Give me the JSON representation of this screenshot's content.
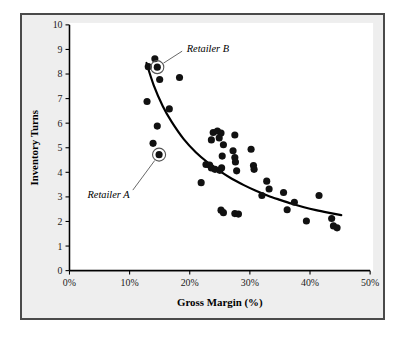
{
  "figure": {
    "frame_color": "#4a4a4a",
    "background_color": "#eeeeee",
    "plot_background_color": "#ffffff"
  },
  "chart_data": {
    "type": "scatter",
    "title": "",
    "xlabel": "Gross Margin (%)",
    "ylabel": "Inventory Turns",
    "xlim": [
      0,
      50
    ],
    "ylim": [
      0,
      10
    ],
    "xticks": [
      0,
      10,
      20,
      30,
      40,
      50
    ],
    "xtick_labels": [
      "0%",
      "10%",
      "20%",
      "30%",
      "40%",
      "50%"
    ],
    "yticks": [
      0,
      1,
      2,
      3,
      4,
      5,
      6,
      7,
      8,
      9,
      10
    ],
    "ytick_labels": [
      "0",
      "1",
      "2",
      "3",
      "4",
      "5",
      "6",
      "7",
      "8",
      "9",
      "10"
    ],
    "grid": false,
    "legend": null,
    "marker_color": "#111111",
    "trendline_color": "#000000",
    "points": [
      [
        13.1,
        8.3
      ],
      [
        14.2,
        8.62
      ],
      [
        14.6,
        8.28
      ],
      [
        15.0,
        7.78
      ],
      [
        18.3,
        7.86
      ],
      [
        12.9,
        6.88
      ],
      [
        16.6,
        6.58
      ],
      [
        14.6,
        5.88
      ],
      [
        13.9,
        5.18
      ],
      [
        14.9,
        4.72
      ],
      [
        23.9,
        5.62
      ],
      [
        24.6,
        5.68
      ],
      [
        25.2,
        5.6
      ],
      [
        24.9,
        5.4
      ],
      [
        27.5,
        5.52
      ],
      [
        23.6,
        5.32
      ],
      [
        25.6,
        5.12
      ],
      [
        25.4,
        4.66
      ],
      [
        27.2,
        4.88
      ],
      [
        27.5,
        4.6
      ],
      [
        27.6,
        4.42
      ],
      [
        30.2,
        4.94
      ],
      [
        22.7,
        4.32
      ],
      [
        23.3,
        4.3
      ],
      [
        23.6,
        4.18
      ],
      [
        24.2,
        4.12
      ],
      [
        25.0,
        4.08
      ],
      [
        25.3,
        4.18
      ],
      [
        27.8,
        4.06
      ],
      [
        30.6,
        4.28
      ],
      [
        30.7,
        4.12
      ],
      [
        21.9,
        3.58
      ],
      [
        32.8,
        3.64
      ],
      [
        33.2,
        3.32
      ],
      [
        32.0,
        3.06
      ],
      [
        35.6,
        3.18
      ],
      [
        37.4,
        2.78
      ],
      [
        41.5,
        3.06
      ],
      [
        36.2,
        2.48
      ],
      [
        25.2,
        2.46
      ],
      [
        25.6,
        2.36
      ],
      [
        27.5,
        2.32
      ],
      [
        28.1,
        2.3
      ],
      [
        39.4,
        2.02
      ],
      [
        43.6,
        2.12
      ],
      [
        43.9,
        1.82
      ],
      [
        44.5,
        1.74
      ]
    ],
    "trendline": [
      [
        12.8,
        8.45
      ],
      [
        14.0,
        7.55
      ],
      [
        15.5,
        6.7
      ],
      [
        17.0,
        6.05
      ],
      [
        19.0,
        5.35
      ],
      [
        21.0,
        4.82
      ],
      [
        23.0,
        4.4
      ],
      [
        25.0,
        4.05
      ],
      [
        27.0,
        3.74
      ],
      [
        29.0,
        3.48
      ],
      [
        31.0,
        3.25
      ],
      [
        33.0,
        3.05
      ],
      [
        35.0,
        2.88
      ],
      [
        37.0,
        2.72
      ],
      [
        39.0,
        2.58
      ],
      [
        41.0,
        2.46
      ],
      [
        43.0,
        2.36
      ],
      [
        45.2,
        2.26
      ]
    ],
    "annotations": [
      {
        "label": "Retailer B",
        "point": [
          14.6,
          8.28
        ],
        "label_x": 19.5,
        "label_y": 9.05,
        "highlight": true
      },
      {
        "label": "Retailer A",
        "point": [
          14.9,
          4.72
        ],
        "label_x": 10.0,
        "label_y": 3.1,
        "highlight": true
      }
    ]
  }
}
